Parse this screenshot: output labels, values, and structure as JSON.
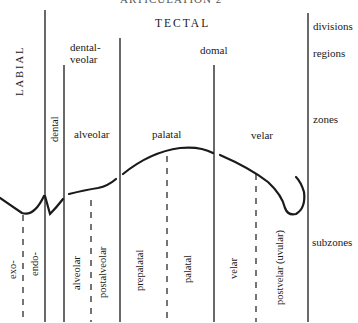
{
  "header": {
    "truncated_text": "ARTICULATION 2"
  },
  "divisions": {
    "left": "LABIAL",
    "right": "TECTAL"
  },
  "regions": {
    "dental_veolar_line1": "dental-",
    "dental_veolar_line2": "veolar",
    "domal": "domal"
  },
  "zones": {
    "dental": "dental",
    "alveolar": "alveolar",
    "palatal": "palatal",
    "velar": "velar"
  },
  "subzones": [
    {
      "label": "exo-"
    },
    {
      "label": "endo-"
    },
    {
      "label": "alveolar"
    },
    {
      "label": "postalveolar"
    },
    {
      "label": "prepalatal"
    },
    {
      "label": "palatal"
    },
    {
      "label": "velar"
    },
    {
      "label": "postvelar (uvular)"
    }
  ],
  "row_labels": {
    "divisions": "divisions",
    "regions": "regions",
    "zones": "zones",
    "subzones": "subzones"
  },
  "colors": {
    "ink": "#1a1a1a",
    "background": "#ffffff"
  }
}
